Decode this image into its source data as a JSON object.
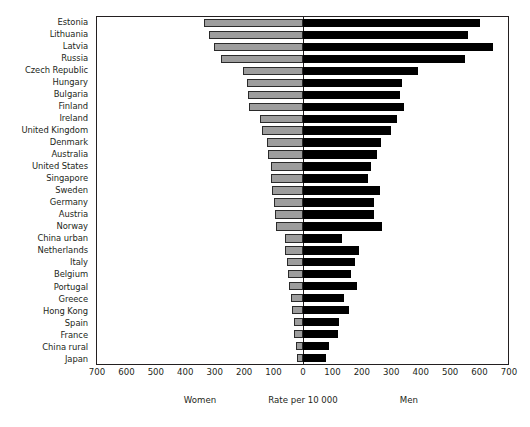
{
  "chart_data": {
    "type": "bar",
    "subtype": "diverging-horizontal-population-pyramid",
    "title": "",
    "xlabel": "Rate per 10 000",
    "ylabel": "",
    "grid": false,
    "legend_position": "below-axis",
    "axis": {
      "tick_labels": [
        "700",
        "600",
        "500",
        "400",
        "300",
        "200",
        "100",
        "0",
        "100",
        "200",
        "300",
        "400",
        "500",
        "600",
        "700"
      ],
      "tick_values": [
        -700,
        -600,
        -500,
        -400,
        -300,
        -200,
        -100,
        0,
        100,
        200,
        300,
        400,
        500,
        600,
        700
      ],
      "xlim": [
        -700,
        700
      ],
      "units": "Rate per 10 000"
    },
    "captions": {
      "left": "Women",
      "center": "Rate per 10 000",
      "right": "Men"
    },
    "series": [
      {
        "name": "Women",
        "color": "#9d9d9d",
        "side": "left"
      },
      {
        "name": "Men",
        "color": "#000000",
        "side": "right"
      }
    ],
    "categories": [
      "Estonia",
      "Lithuania",
      "Latvia",
      "Russia",
      "Czech Republic",
      "Hungary",
      "Bulgaria",
      "Finland",
      "Ireland",
      "United Kingdom",
      "Denmark",
      "Australia",
      "United States",
      "Singapore",
      "Sweden",
      "Germany",
      "Austria",
      "Norway",
      "China urban",
      "Netherlands",
      "Italy",
      "Belgium",
      "Portugal",
      "Greece",
      "Hong Kong",
      "Spain",
      "France",
      "China rural",
      "Japan"
    ],
    "rows": [
      {
        "category": "Estonia",
        "women": 335,
        "men": 600
      },
      {
        "category": "Lithuania",
        "women": 320,
        "men": 562
      },
      {
        "category": "Latvia",
        "women": 302,
        "men": 645
      },
      {
        "category": "Russia",
        "women": 280,
        "men": 552
      },
      {
        "category": "Czech Republic",
        "women": 205,
        "men": 390
      },
      {
        "category": "Hungary",
        "women": 190,
        "men": 335
      },
      {
        "category": "Bulgaria",
        "women": 188,
        "men": 330
      },
      {
        "category": "Finland",
        "women": 185,
        "men": 342
      },
      {
        "category": "Ireland",
        "women": 145,
        "men": 318
      },
      {
        "category": "United Kingdom",
        "women": 140,
        "men": 300
      },
      {
        "category": "Denmark",
        "women": 122,
        "men": 265
      },
      {
        "category": "Australia",
        "women": 118,
        "men": 252
      },
      {
        "category": "United States",
        "women": 110,
        "men": 232
      },
      {
        "category": "Singapore",
        "women": 108,
        "men": 222
      },
      {
        "category": "Sweden",
        "women": 104,
        "men": 262
      },
      {
        "category": "Germany",
        "women": 100,
        "men": 242
      },
      {
        "category": "Austria",
        "women": 96,
        "men": 240
      },
      {
        "category": "Norway",
        "women": 92,
        "men": 270
      },
      {
        "category": "China urban",
        "women": 62,
        "men": 132
      },
      {
        "category": "Netherlands",
        "women": 60,
        "men": 190
      },
      {
        "category": "Italy",
        "women": 55,
        "men": 178
      },
      {
        "category": "Belgium",
        "women": 52,
        "men": 162
      },
      {
        "category": "Portugal",
        "women": 48,
        "men": 185
      },
      {
        "category": "Greece",
        "women": 42,
        "men": 140
      },
      {
        "category": "Hong Kong",
        "women": 38,
        "men": 158
      },
      {
        "category": "Spain",
        "women": 32,
        "men": 122
      },
      {
        "category": "France",
        "women": 30,
        "men": 120
      },
      {
        "category": "China rural",
        "women": 25,
        "men": 90
      },
      {
        "category": "Japan",
        "women": 20,
        "men": 78
      }
    ],
    "colors": {
      "women_fill": "#9d9d9d",
      "men_fill": "#000000",
      "axis": "#231f20",
      "background": "#ffffff"
    }
  }
}
